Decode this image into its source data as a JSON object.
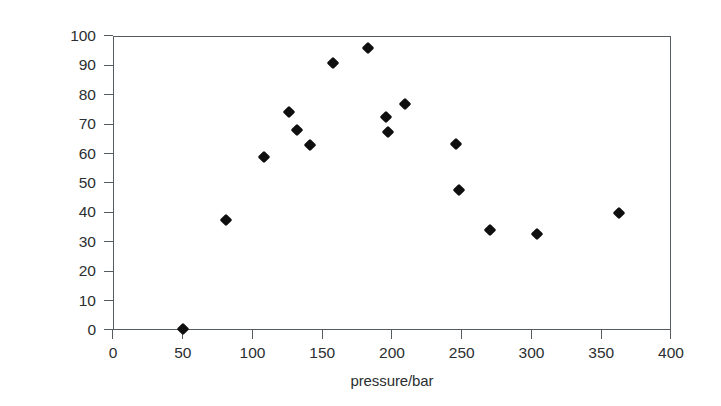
{
  "chart_data": {
    "type": "scatter",
    "title": "",
    "subtitle": "",
    "xlabel": "pressure/bar",
    "ylabel": "diasteromeric excess/%",
    "xlim": [
      0,
      400
    ],
    "ylim": [
      0,
      100
    ],
    "xticks": [
      0,
      50,
      100,
      150,
      200,
      250,
      300,
      350,
      400
    ],
    "xtick_labels": [
      "0",
      "50",
      "100",
      "150",
      "200",
      "250",
      "300",
      "350",
      "400"
    ],
    "yticks": [
      0,
      10,
      20,
      30,
      40,
      50,
      60,
      70,
      80,
      90,
      100
    ],
    "ytick_labels": [
      "0",
      "10",
      "20",
      "30",
      "40",
      "50",
      "60",
      "70",
      "80",
      "90",
      "100"
    ],
    "grid": false,
    "legend": null,
    "marker": "diamond",
    "marker_color": "#100f10",
    "series": [
      {
        "name": "diastereomeric excess vs pressure",
        "x": [
          50,
          81,
          108,
          126,
          132,
          141,
          158,
          183,
          196,
          197,
          209,
          246,
          248,
          270,
          304,
          363
        ],
        "y": [
          0.3,
          37.5,
          58.9,
          74.0,
          68.0,
          62.8,
          90.8,
          96.0,
          72.5,
          67.5,
          77.0,
          63.2,
          47.5,
          34.0,
          32.5,
          39.8
        ]
      }
    ],
    "points": [
      {
        "x": 50,
        "y": 0.3
      },
      {
        "x": 81,
        "y": 37.5
      },
      {
        "x": 108,
        "y": 58.9
      },
      {
        "x": 126,
        "y": 74.0
      },
      {
        "x": 132,
        "y": 68.0
      },
      {
        "x": 141,
        "y": 62.8
      },
      {
        "x": 158,
        "y": 90.8
      },
      {
        "x": 183,
        "y": 96.0
      },
      {
        "x": 196,
        "y": 72.5
      },
      {
        "x": 197,
        "y": 67.5
      },
      {
        "x": 209,
        "y": 77.0
      },
      {
        "x": 246,
        "y": 63.2
      },
      {
        "x": 248,
        "y": 47.5
      },
      {
        "x": 270,
        "y": 34.0
      },
      {
        "x": 304,
        "y": 32.5
      },
      {
        "x": 363,
        "y": 39.8
      }
    ],
    "n_points": 16,
    "axis_color": "#555b5e",
    "text_color": "#2b2f31",
    "background_color": "#ffffff"
  }
}
